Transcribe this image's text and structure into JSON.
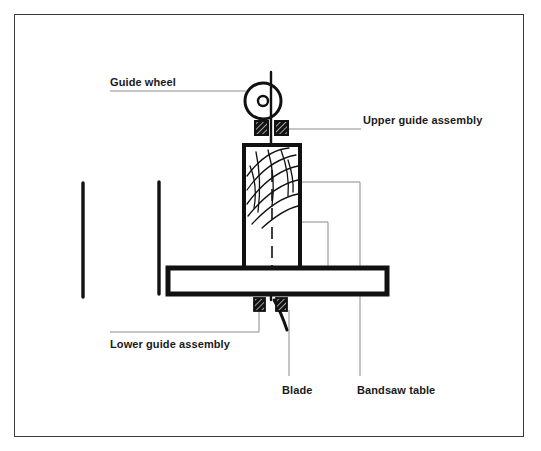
{
  "diagram": {
    "type": "technical-line-drawing",
    "background_color": "#ffffff",
    "ink_color": "#111111",
    "leader_line_color": "#8c8c8c",
    "frame": {
      "stroke_color": "#3a3a3a",
      "x": 14,
      "y": 14,
      "width": 510,
      "height": 423
    },
    "labels": [
      {
        "id": "guide-wheel",
        "text": "Guide wheel",
        "x": 110,
        "y": 76,
        "leader": "horizontal line running right from under the text to the guide wheel"
      },
      {
        "id": "upper-guide-assembly",
        "text": "Upper guide assembly",
        "x": 363,
        "y": 114,
        "leader": "horizontal line running left from under the text to the right upper guide block"
      },
      {
        "id": "lower-guide-assembly",
        "text": "Lower guide assembly",
        "x": 110,
        "y": 338,
        "leader": "horizontal line running right then up to the left lower guide block"
      },
      {
        "id": "blade",
        "text": "Blade",
        "x": 282,
        "y": 384,
        "leader": "vertical line running up from above the text to the blade below the table"
      },
      {
        "id": "bandsaw-table",
        "text": "Bandsaw table",
        "x": 357,
        "y": 384,
        "leader": "vertical line running up from above the text to the bandsaw table"
      }
    ],
    "parts": {
      "guide_wheel": {
        "name": "Guide wheel",
        "center_x": 263,
        "center_y": 101,
        "outer_radius": 18,
        "hub_radius": 5
      },
      "blade": {
        "name": "Blade",
        "description": "Vertical saw blade running from top past the wheel through the workpiece and table"
      },
      "upper_guide_blocks": {
        "name": "Upper guide assembly",
        "count": 2,
        "description": "Two small hatched square guide blocks flanking the blade above the workpiece"
      },
      "lower_guide_blocks": {
        "name": "Lower guide assembly",
        "count": 2,
        "description": "Two small hatched square guide blocks flanking the blade below the table"
      },
      "workpiece": {
        "name": "Wood workpiece",
        "description": "Tall rectangular board with diagonal wood-grain hatching standing on the table",
        "centerline": "dashed vertical cut line"
      },
      "bandsaw_table": {
        "name": "Bandsaw table",
        "description": "Wide horizontal rectangular table"
      },
      "fence_left": {
        "name": "Left vertical post",
        "description": "Free-standing vertical line at far left"
      },
      "table_support": {
        "name": "Table support bracket",
        "description": "L-shaped vertical line joining the left end of the table"
      }
    }
  }
}
